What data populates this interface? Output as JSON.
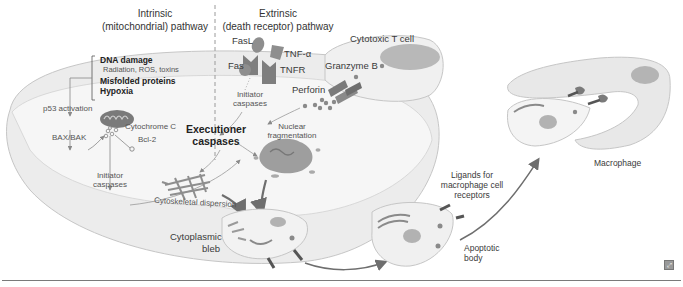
{
  "diagram": {
    "type": "apoptosis-pathways",
    "headers": {
      "intrinsic_line1": "Intrinsic",
      "intrinsic_line2": "(mitochondrial) pathway",
      "extrinsic_line1": "Extrinsic",
      "extrinsic_line2": "(death receptor) pathway"
    },
    "triggers": {
      "dna_damage": "DNA damage",
      "dna_damage_causes": "Radiation, ROS, toxins",
      "misfolded": "Misfolded proteins",
      "hypoxia": "Hypoxia"
    },
    "intrinsic": {
      "p53": "p53 activation",
      "bax_bak": "BAX/BAK",
      "cytochrome_c": "Cytochrome C",
      "bcl2": "Bcl-2",
      "initiator_line1": "Initiator",
      "initiator_line2": "caspases"
    },
    "extrinsic": {
      "fasl": "FasL",
      "fas": "Fas",
      "tnf_alpha": "TNF-α",
      "tnfr": "TNFR",
      "initiator_line1": "Initiator",
      "initiator_line2": "caspases"
    },
    "t_cell": {
      "title": "Cytotoxic T cell",
      "granzyme": "Granzyme B",
      "perforin": "Perforin"
    },
    "executioner_line1": "Executioner",
    "executioner_line2": "caspases",
    "nuclear_line1": "Nuclear",
    "nuclear_line2": "fragmentation",
    "cytoskeletal": "Cytoskeletal dispersion",
    "bleb_line1": "Cytoplasmic",
    "bleb_line2": "bleb",
    "ligands_line1": "Ligands for",
    "ligands_line2": "macrophage cell",
    "ligands_line3": "receptors",
    "apoptotic_line1": "Apoptotic",
    "apoptotic_line2": "body",
    "macrophage": "Macrophage",
    "colors": {
      "cell_fill": "#efefef",
      "cell_edge": "#c8c8c8",
      "cell_shadow": "#dcdcdc",
      "organelle": "#9a9a9a",
      "dark": "#5a5a5a",
      "arrow": "#6e6e6e"
    }
  }
}
